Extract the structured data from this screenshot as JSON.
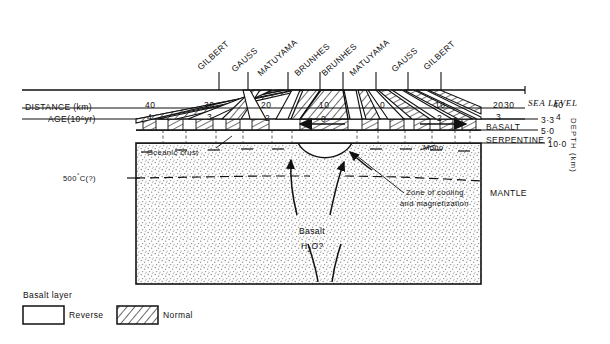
{
  "figure": {
    "epoch_labels": [
      {
        "text": "GILBERT",
        "x": 205,
        "y": 55,
        "tick_x": 219,
        "angle": -42
      },
      {
        "text": "GAUSS",
        "x": 238,
        "y": 58,
        "tick_x": 248,
        "angle": -42
      },
      {
        "text": "MATUYAMA",
        "x": 268,
        "y": 60,
        "tick_x": 288,
        "angle": -42
      },
      {
        "text": "BRUNHES",
        "x": 303,
        "y": 60,
        "tick_x": 320,
        "angle": -42
      },
      {
        "text": "BRUNHES",
        "x": 328,
        "y": 60,
        "tick_x": 343,
        "angle": -42
      },
      {
        "text": "MATUYAMA",
        "x": 358,
        "y": 60,
        "tick_x": 376,
        "angle": -42
      },
      {
        "text": "GAUSS",
        "x": 398,
        "y": 58,
        "tick_x": 408,
        "angle": -42
      },
      {
        "text": "GILBERT",
        "x": 427,
        "y": 55,
        "tick_x": 441,
        "angle": -42
      }
    ],
    "axes": {
      "distance_label": "DISTANCE (km)",
      "age_label": "AGE(10⁶yr)",
      "distance_ticks": [
        {
          "value": "40",
          "x": 151
        },
        {
          "value": "30",
          "x": 210
        },
        {
          "value": "20",
          "x": 267
        },
        {
          "value": "10",
          "x": 325
        },
        {
          "value": "0",
          "x": 383
        },
        {
          "value": "10",
          "x": 441
        },
        {
          "value": "20",
          "x": 499
        },
        {
          "value": "30",
          "x": 537
        },
        {
          "value": "40",
          "x": 560
        }
      ],
      "age_ticks": [
        {
          "value": "4",
          "x": 151
        },
        {
          "value": "3",
          "x": 210
        },
        {
          "value": "2",
          "x": 267
        },
        {
          "value": "0",
          "x": 383
        },
        {
          "value": "2",
          "x": 499
        },
        {
          "value": "3",
          "x": 537
        },
        {
          "value": "4",
          "x": 560
        }
      ],
      "sea_level": "SEA LEVEL",
      "depth_axis_label": "DEPTH (km)",
      "depth_ticks": [
        "3·3",
        "5·0",
        "10·0"
      ]
    },
    "layers": {
      "basalt": "BASALT",
      "serpentine": "SERPENTINE ?",
      "mantle": "MANTLE",
      "oceanic_crust": "Oceanic crust",
      "moho": "Moho"
    },
    "annotations": {
      "isotherm": "500°C(?)",
      "cooling_zone_line1": "Zone of cooling",
      "cooling_zone_line2": "and magnetization",
      "basalt_source_line1": "Basalt",
      "basalt_source_line2": "H₂O?"
    },
    "legend": {
      "title": "Basalt layer",
      "reverse": "Reverse",
      "normal": "Normal"
    },
    "colors": {
      "ink": "#111111",
      "stipple": "#9a9a9a",
      "hatch": "#222222"
    }
  }
}
